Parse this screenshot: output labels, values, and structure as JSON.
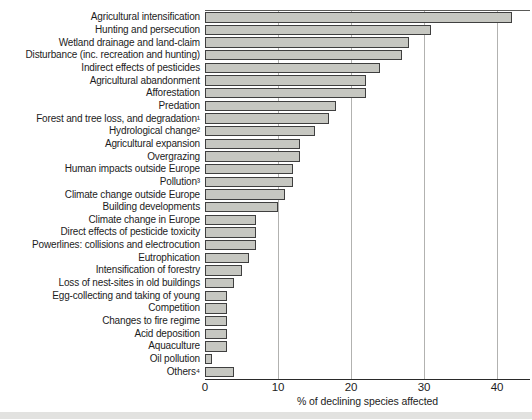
{
  "chart_data": {
    "type": "bar",
    "orientation": "horizontal",
    "title": "",
    "xlabel": "% of declining species affected",
    "ylabel": "",
    "xlim": [
      0,
      44.5
    ],
    "xticks": [
      0,
      10,
      20,
      30,
      40
    ],
    "grid": "vertical-gridlines-behind-bars",
    "legend": "none",
    "categories": [
      "Agricultural intensification",
      "Hunting and persecution",
      "Wetland drainage and land-claim",
      "Disturbance (inc. recreation and hunting)",
      "Indirect effects of pesticides",
      "Agricultural abandonment",
      "Afforestation",
      "Predation",
      "Forest and tree loss, and degradation¹",
      "Hydrological change²",
      "Agricultural expansion",
      "Overgrazing",
      "Human impacts outside Europe",
      "Pollution³",
      "Climate change outside Europe",
      "Building developments",
      "Climate change in Europe",
      "Direct effects of pesticide toxicity",
      "Powerlines: collisions and electrocution",
      "Eutrophication",
      "Intensification of forestry",
      "Loss of nest-sites in old buildings",
      "Egg-collecting and taking of young",
      "Competition",
      "Changes to fire regime",
      "Acid deposition",
      "Aquaculture",
      "Oil pollution",
      "Others⁴"
    ],
    "values": [
      42,
      31,
      28,
      27,
      24,
      22,
      22,
      18,
      17,
      15,
      13,
      13,
      12,
      12,
      11,
      10,
      7,
      7,
      7,
      6,
      5,
      4,
      3,
      3,
      3,
      3,
      3,
      1,
      4
    ]
  },
  "colors": {
    "background": "#ffffff",
    "bar_fill": "#c6c7c1",
    "bar_border": "#3f3f3f",
    "gridline": "#b2b2b0",
    "axis_line": "#2a2a2a",
    "frame_line": "#5a5a58",
    "text": "#1c1c1c",
    "bottom_band": "#e2e2e0"
  }
}
